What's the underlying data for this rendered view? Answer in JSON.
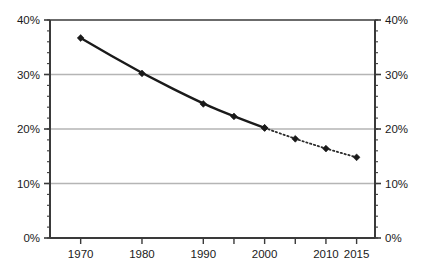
{
  "chart_data": {
    "type": "line",
    "title": "",
    "subtitle": "",
    "xlabel": "",
    "ylabel": "",
    "xlim": [
      1965,
      2018
    ],
    "ylim": [
      0,
      40
    ],
    "grid": true,
    "legend_position": "none",
    "x_tick_labels": [
      "1970",
      "1980",
      "1990",
      "2000",
      "2010",
      "2015"
    ],
    "x_tick_values": [
      1970,
      1980,
      1990,
      2000,
      2010,
      2015
    ],
    "x_unlabeled_ticks": [
      1995,
      2005
    ],
    "y_tick_labels_left": [
      "40%",
      "30%",
      "20%",
      "10%",
      "0%"
    ],
    "y_tick_labels_right": [
      "40%",
      "30%",
      "20%",
      "10%",
      "0%"
    ],
    "y_tick_values": [
      40,
      30,
      20,
      10,
      0
    ],
    "y_minor_tick_step": 2,
    "gridline_values": [
      10,
      20,
      30
    ],
    "series": [
      {
        "name": "observed",
        "style": "solid",
        "marker": "diamond",
        "color": "#1a1a1a",
        "x": [
          1970,
          1980,
          1990,
          1995,
          2000
        ],
        "values": [
          36.7,
          30.2,
          24.6,
          22.3,
          20.2
        ]
      },
      {
        "name": "projected",
        "style": "dotted",
        "marker": "diamond",
        "color": "#2b2b2b",
        "x": [
          2000,
          2005,
          2010,
          2015
        ],
        "values": [
          20.2,
          18.2,
          16.4,
          14.8
        ]
      }
    ],
    "colors": {
      "line": "#1a1a1a",
      "marker": "#1a1a1a",
      "axis": "#3a3a3a",
      "gridline": "#b5b5b5",
      "background": "#ffffff",
      "text": "#1a1a1a"
    }
  }
}
